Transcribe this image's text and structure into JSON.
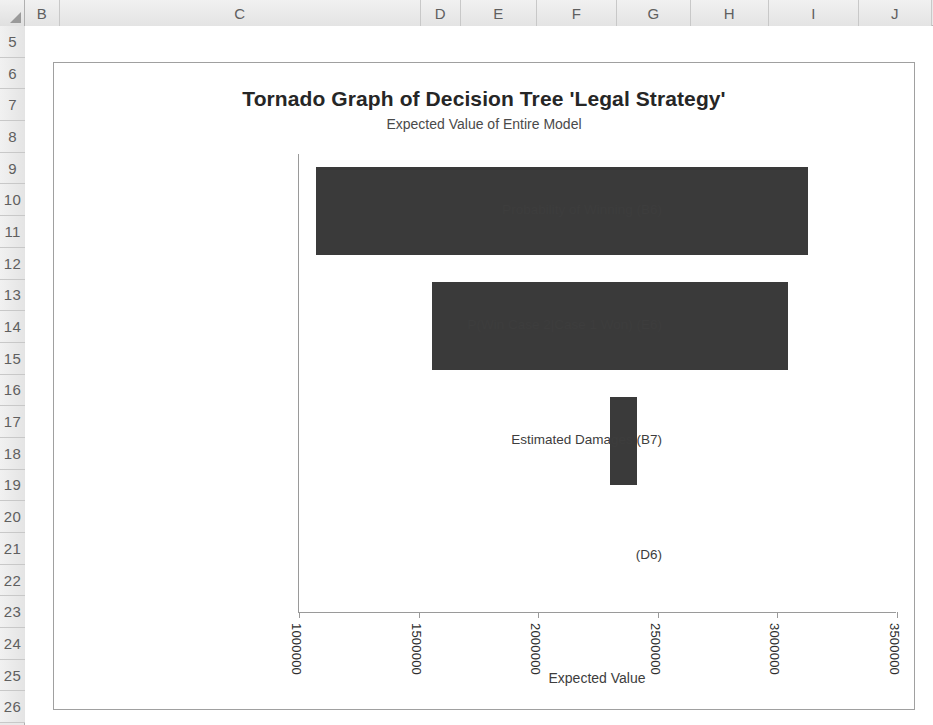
{
  "spreadsheet": {
    "corner_icon": "select-all-triangle-icon",
    "column_headers": [
      "B",
      "C",
      "D",
      "E",
      "F",
      "G",
      "H",
      "I",
      "J"
    ],
    "row_headers": [
      "5",
      "6",
      "7",
      "8",
      "9",
      "10",
      "11",
      "12",
      "13",
      "14",
      "15",
      "16",
      "17",
      "18",
      "19",
      "20",
      "21",
      "22",
      "23",
      "24",
      "25",
      "26"
    ]
  },
  "chart_data": {
    "type": "bar",
    "orientation": "horizontal",
    "title": "Tornado Graph of Decision Tree 'Legal Strategy'",
    "subtitle": "Expected Value of Entire Model",
    "xlabel": "Expected Value",
    "ylabel": "",
    "grid": false,
    "legend": null,
    "bar_color": "#3a3a3a",
    "xlim": [
      1000000,
      3500000
    ],
    "xticks": [
      1000000,
      1500000,
      2000000,
      2500000,
      3000000,
      3500000
    ],
    "xtick_labels": [
      "1000000",
      "1500000",
      "2000000",
      "2500000",
      "3000000",
      "3500000"
    ],
    "categories": [
      "Probability of Winning (B6)",
      "P(Win Case 2|Case 1 Won) (E6)",
      "Estimated Damages (B7)",
      "(D6)"
    ],
    "bars": [
      {
        "category": "Probability of Winning (B6)",
        "low": 1070000,
        "high": 3130000,
        "span": 2060000
      },
      {
        "category": "P(Win Case 2|Case 1 Won) (E6)",
        "low": 1555000,
        "high": 3045000,
        "span": 1490000
      },
      {
        "category": "Estimated Damages (B7)",
        "low": 2300000,
        "high": 2415000,
        "span": 115000
      },
      {
        "category": "(D6)",
        "low": 0,
        "high": 0,
        "span": 0
      }
    ]
  }
}
